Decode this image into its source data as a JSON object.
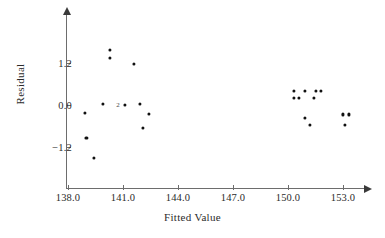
{
  "chart_data": {
    "type": "scatter",
    "title": "",
    "xlabel": "Fitted Value",
    "ylabel": "Residual",
    "xlim": [
      136.6,
      155.0
    ],
    "ylim": [
      -2.1,
      2.6
    ],
    "grid": false,
    "legend": null,
    "xticks": [
      138.0,
      141.0,
      144.0,
      147.0,
      150.0,
      153.0
    ],
    "xtick_labels": [
      "138.0",
      "141.0",
      "144.0",
      "147.0",
      "150.0",
      "153.0"
    ],
    "yticks": [
      1.2,
      0.0,
      -1.2
    ],
    "ytick_labels": [
      "1.2",
      "0.0",
      "−1.2"
    ],
    "marker": "filled-circle",
    "marker_color": "#111111",
    "axis_color": "#6d6d6d",
    "points": [
      {
        "x": 140.3,
        "y": 1.58,
        "label": ""
      },
      {
        "x": 140.3,
        "y": 1.35,
        "label": ""
      },
      {
        "x": 141.6,
        "y": 1.18,
        "label": ""
      },
      {
        "x": 139.9,
        "y": 0.02,
        "label": ""
      },
      {
        "x": 141.1,
        "y": 0.0,
        "label": "2"
      },
      {
        "x": 141.9,
        "y": 0.02,
        "label": ""
      },
      {
        "x": 138.9,
        "y": -0.22,
        "label": ""
      },
      {
        "x": 142.4,
        "y": -0.25,
        "label": ""
      },
      {
        "x": 142.1,
        "y": -0.65,
        "label": ""
      },
      {
        "x": 139.0,
        "y": -0.93,
        "label": ""
      },
      {
        "x": 139.4,
        "y": -1.52,
        "label": ""
      },
      {
        "x": 150.3,
        "y": 0.4,
        "label": ""
      },
      {
        "x": 150.9,
        "y": 0.4,
        "label": ""
      },
      {
        "x": 151.5,
        "y": 0.4,
        "label": ""
      },
      {
        "x": 151.8,
        "y": 0.4,
        "label": ""
      },
      {
        "x": 150.3,
        "y": 0.2,
        "label": ""
      },
      {
        "x": 150.6,
        "y": 0.2,
        "label": ""
      },
      {
        "x": 151.4,
        "y": 0.2,
        "label": ""
      },
      {
        "x": 153.0,
        "y": -0.27,
        "label": ""
      },
      {
        "x": 153.3,
        "y": -0.27,
        "label": ""
      },
      {
        "x": 150.9,
        "y": -0.36,
        "label": ""
      },
      {
        "x": 151.2,
        "y": -0.58,
        "label": ""
      },
      {
        "x": 153.1,
        "y": -0.58,
        "label": ""
      }
    ],
    "overlap_annotations": [
      {
        "x": 141.0,
        "y": 0.0,
        "text": "2"
      }
    ]
  }
}
